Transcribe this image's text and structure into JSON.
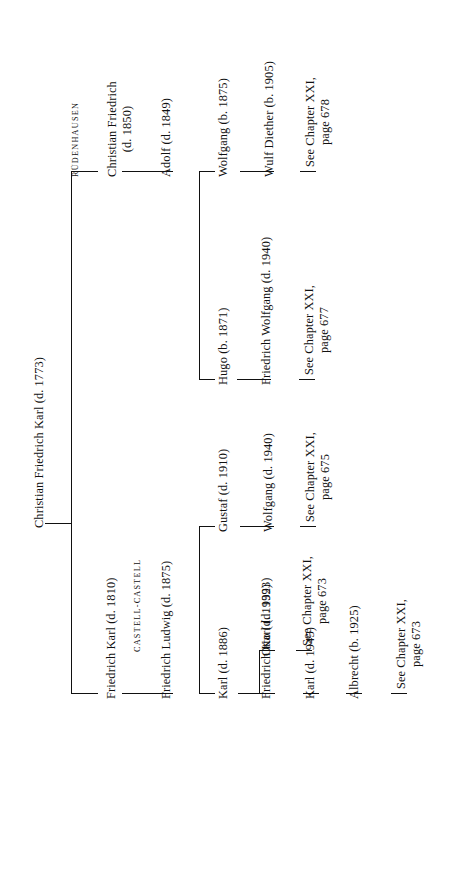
{
  "document": {
    "type": "genealogical-chart",
    "orientation": "rotated-90-ccw",
    "root": "Christian Friedrich Karl (d. 1773)"
  },
  "root": {
    "label": "Christian Friedrich Karl (d. 1773)"
  },
  "branches": {
    "ruedenhausen": {
      "heading": "RÜDENHAUSEN",
      "generation1": {
        "line1": "Christian Friedrich",
        "line2": "(d. 1850)"
      },
      "generation2": {
        "label": "Adolf (d. 1849)"
      },
      "children": [
        {
          "name": "Wolfgang (b. 1875)",
          "child": "Wulf Diether (b. 1905)",
          "reference": {
            "line1": "See Chapter XXI,",
            "line2": "page 678"
          }
        },
        {
          "name": "Hugo (b. 1871)",
          "child": "Friedrich Wolfgang (d. 1940)",
          "reference": {
            "line1": "See Chapter XXI,",
            "line2": "page 677"
          }
        }
      ]
    },
    "castell_castell": {
      "heading": "CASTELL-CASTELL",
      "generation1": {
        "label": "Friedrich Karl (d. 1810)"
      },
      "generation2": {
        "label": "Friedrich Ludwig (d. 1875)"
      },
      "children": [
        {
          "name": "Gustaf (d. 1910)",
          "child": "Wolfgang (d. 1940)",
          "reference": {
            "line1": "See Chapter XXI,",
            "line2": "page 675"
          }
        },
        {
          "name": "Karl (d. 1886)",
          "descendants": [
            {
              "name": "Otto (d. 1939)",
              "reference": {
                "line1": "See Chapter XXI,",
                "line2": "page 673"
              }
            },
            {
              "name": "Friedrich Karl (d. 1923)",
              "child": "Karl (d. 1945)",
              "grandchild": "Albrecht (b. 1925)",
              "reference": {
                "line1": "See Chapter XXI,",
                "line2": "page 673"
              }
            }
          ]
        }
      ]
    }
  },
  "colors": {
    "ink": "#111111",
    "paper": "#ffffff"
  }
}
